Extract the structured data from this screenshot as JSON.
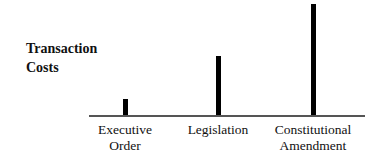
{
  "chart_data": {
    "type": "bar",
    "title": "",
    "xlabel": "",
    "ylabel": "Transaction Costs",
    "categories": [
      "Executive Order",
      "Legislation",
      "Constitutional Amendment"
    ],
    "category_lines": [
      [
        "Executive",
        "Order"
      ],
      [
        "Legislation"
      ],
      [
        "Constitutional",
        "Amendment"
      ]
    ],
    "values": [
      16,
      59,
      111
    ],
    "ylim": [
      0,
      115
    ],
    "grid": false,
    "legend": null,
    "y_ticks": false,
    "note": "Values are relative bar heights (unlabeled y-axis)"
  },
  "labels": {
    "ylabel_line1": "Transaction",
    "ylabel_line2": "Costs",
    "cat0_line1": "Executive",
    "cat0_line2": "Order",
    "cat1_line1": "Legislation",
    "cat2_line1": "Constitutional",
    "cat2_line2": "Amendment"
  }
}
